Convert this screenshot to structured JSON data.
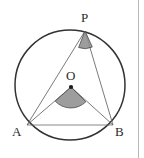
{
  "figure": {
    "type": "circle-geometry-diagram",
    "background_color": "#ffffff",
    "stroke_color": "#333333",
    "thin_stroke_color": "#6b6b6b",
    "angle_fill_color": "#8f8f8f",
    "angle_stroke_color": "#4a4a4a",
    "divider_color": "#b9b9b9"
  },
  "circle": {
    "name": "circle-O",
    "center": {
      "x": 70,
      "y": 85
    },
    "radius": 55,
    "stroke_width": 1.4
  },
  "points": [
    {
      "id": "P",
      "label": "P",
      "x": 85,
      "y": 31,
      "label_x": 81,
      "label_y": 11
    },
    {
      "id": "O",
      "label": "O",
      "x": 71,
      "y": 87,
      "label_x": 66,
      "label_y": 69
    },
    {
      "id": "A",
      "label": "A",
      "x": 27,
      "y": 125,
      "label_x": 12,
      "label_y": 125
    },
    {
      "id": "B",
      "label": "B",
      "x": 113,
      "y": 125,
      "label_x": 115,
      "label_y": 125
    }
  ],
  "segments": [
    {
      "name": "segment-AP",
      "from": "A",
      "to": "P"
    },
    {
      "name": "segment-BP",
      "from": "B",
      "to": "P"
    },
    {
      "name": "segment-AO",
      "from": "A",
      "to": "O"
    },
    {
      "name": "segment-BO",
      "from": "B",
      "to": "O"
    },
    {
      "name": "segment-AB",
      "from": "A",
      "to": "B"
    }
  ],
  "angle_markers": [
    {
      "name": "angle-marker-P",
      "vertex": "P",
      "description": "shaded inscribed angle at P",
      "path": "M 85 31 L 78.6 47.5 A 17.7 17.7 0 0 0 92.3 47.0 Z"
    },
    {
      "name": "angle-marker-O",
      "vertex": "O",
      "description": "shaded central angle at O",
      "path": "M 71 87 L 55.2 101.1 A 21.2 21.2 0 0 0 85.8 101.8 Z"
    }
  ],
  "center_dot": {
    "name": "center-point-O",
    "x": 71,
    "y": 87,
    "radius": 2.1
  },
  "divider": {
    "name": "panel-divider",
    "x": 138
  }
}
